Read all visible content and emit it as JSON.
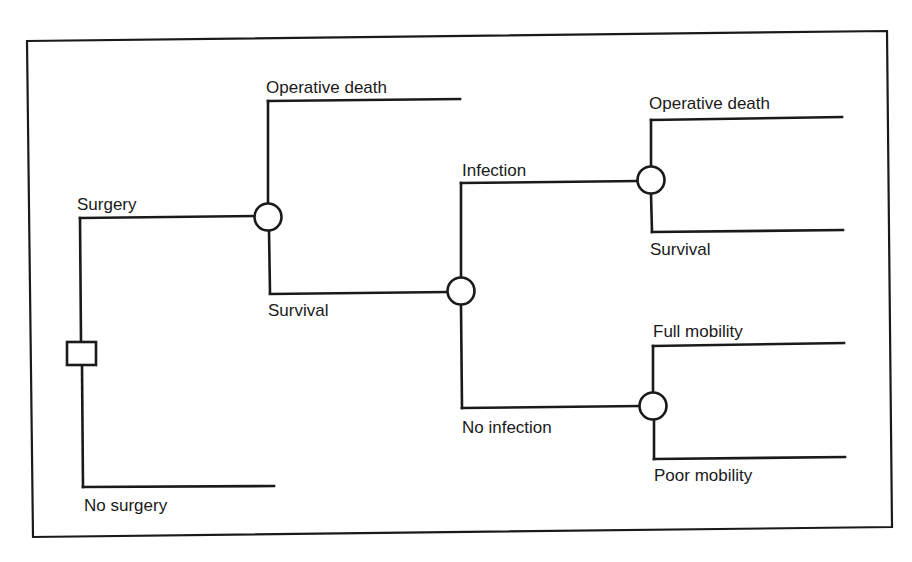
{
  "diagram": {
    "type": "decision-tree",
    "colors": {
      "line": "#1a1a1a",
      "background": "#ffffff"
    },
    "decision_node": {
      "shape": "square"
    },
    "branches": {
      "surgery": "Surgery",
      "no_surgery": "No surgery",
      "operative_death_1": "Operative death",
      "survival_1": "Survival",
      "infection": "Infection",
      "no_infection": "No infection",
      "operative_death_2": "Operative death",
      "survival_2": "Survival",
      "full_mobility": "Full mobility",
      "poor_mobility": "Poor mobility"
    },
    "structure": {
      "root": "decision",
      "children": [
        {
          "label": "Surgery",
          "node": "chance",
          "children": [
            {
              "label": "Operative death"
            },
            {
              "label": "Survival",
              "node": "chance",
              "children": [
                {
                  "label": "Infection",
                  "node": "chance",
                  "children": [
                    {
                      "label": "Operative death"
                    },
                    {
                      "label": "Survival"
                    }
                  ]
                },
                {
                  "label": "No infection",
                  "node": "chance",
                  "children": [
                    {
                      "label": "Full mobility"
                    },
                    {
                      "label": "Poor mobility"
                    }
                  ]
                }
              ]
            }
          ]
        },
        {
          "label": "No surgery"
        }
      ]
    }
  }
}
